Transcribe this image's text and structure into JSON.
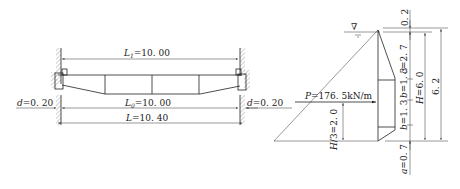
{
  "left_diagram": {
    "title": "beam-span-elevation",
    "dims": {
      "L1": {
        "sym": "L",
        "sub": "1",
        "val": "=10. 00"
      },
      "L0": {
        "sym": "L",
        "sub": "0",
        "val": "=10. 00"
      },
      "L": {
        "sym": "L",
        "sub": "",
        "val": "=10. 40"
      },
      "d_left": {
        "sym": "d",
        "val": "=0. 20"
      },
      "d_right": {
        "sym": "d",
        "val": "=0. 20"
      }
    }
  },
  "right_diagram": {
    "title": "hydrostatic-pressure-on-gate",
    "water_level_symbol": "∇",
    "force": {
      "sym": "P",
      "val": "=176. 5kN/m"
    },
    "dims": {
      "top_gap": "0. 2",
      "c": {
        "sym": "c",
        "val": "=2. 7"
      },
      "b_upper": {
        "sym": "b",
        "val": "=1. 3"
      },
      "b_lower": {
        "sym": "b",
        "val": "=1. 3"
      },
      "H": {
        "sym": "H",
        "val": "=6. 0"
      },
      "total": "6. 2",
      "H_third": {
        "sym": "H",
        "val": "/3=2. 0"
      },
      "a": {
        "sym": "a",
        "val": "=0. 7"
      }
    }
  }
}
